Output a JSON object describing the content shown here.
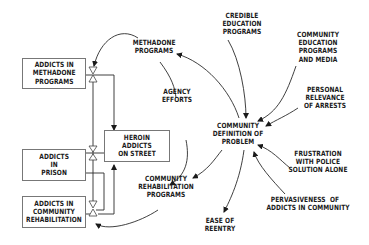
{
  "diagram": {
    "type": "stock-and-flow causal diagram",
    "stocks": [
      {
        "id": "methadone",
        "label": "ADDICTS IN\nMETHADONE\nPROGRAMS"
      },
      {
        "id": "street",
        "label": "HEROIN\nADDICTS\nON STREET"
      },
      {
        "id": "prison",
        "label": "ADDICTS\nIN\nPRISON"
      },
      {
        "id": "rehab",
        "label": "ADDICTS IN\nCOMMUNITY\nREHABILITATION"
      }
    ],
    "variables": [
      {
        "id": "methadone_programs",
        "label": "METHADONE\nPROGRAMS"
      },
      {
        "id": "agency_efforts",
        "label": "AGENCY\nEFFORTS"
      },
      {
        "id": "community_rehab_programs",
        "label": "COMMUNITY\nREHABILITATION\nPROGRAMS"
      },
      {
        "id": "ease_of_reentry",
        "label": "EASE OF\nREENTRY"
      },
      {
        "id": "community_definition",
        "label": "COMMUNITY\nDEFINITION OF\nPROBLEM"
      },
      {
        "id": "credible_education",
        "label": "CREDIBLE\nEDUCATION\nPROGRAMS"
      },
      {
        "id": "community_education_media",
        "label": "COMMUNITY\nEDUCATION\nPROGRAMS\nAND MEDIA"
      },
      {
        "id": "personal_relevance",
        "label": "PERSONAL\nRELEVANCE\nOF ARRESTS"
      },
      {
        "id": "frustration_police",
        "label": "FRUSTRATION\nWITH POLICE\nSOLUTION ALONE"
      },
      {
        "id": "pervasiveness",
        "label": "PERVASIVENESS  OF\nADDICTS IN COMMUNITY"
      }
    ],
    "links": [
      {
        "from": "credible_education",
        "to": "community_definition"
      },
      {
        "from": "community_education_media",
        "to": "community_definition"
      },
      {
        "from": "personal_relevance",
        "to": "community_definition"
      },
      {
        "from": "frustration_police",
        "to": "community_definition"
      },
      {
        "from": "pervasiveness",
        "to": "community_definition"
      },
      {
        "from": "community_definition",
        "to": "methadone_programs"
      },
      {
        "from": "community_definition",
        "to": "community_rehab_programs"
      },
      {
        "from": "community_definition",
        "to": "ease_of_reentry"
      },
      {
        "from": "agency_efforts",
        "to": "community_rehab_programs"
      },
      {
        "from": "methadone_programs",
        "to": "methadone_valve"
      },
      {
        "from": "community_rehab_programs",
        "to": "rehab_valve"
      }
    ],
    "colors": {
      "ink": "#1a1a1a",
      "box_border": "#777777",
      "background": "#ffffff"
    }
  }
}
